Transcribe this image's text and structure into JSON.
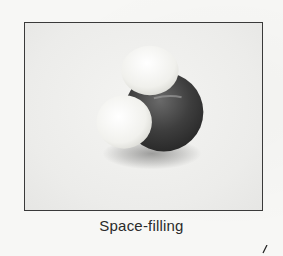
{
  "figure": {
    "atoms": [
      {
        "role": "central",
        "color": "#3d3d3d"
      },
      {
        "role": "top",
        "color": "#f2f2ee"
      },
      {
        "role": "left",
        "color": "#f4f4f0"
      }
    ],
    "caption": "Space-filling"
  }
}
